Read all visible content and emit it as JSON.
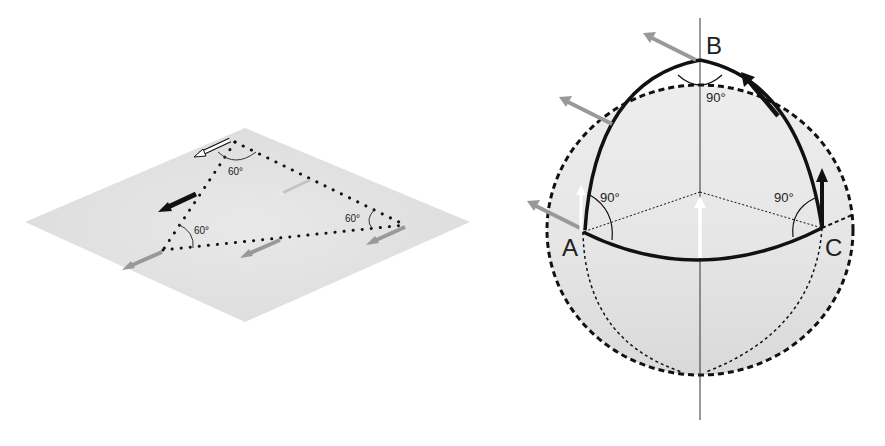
{
  "flat_diagram": {
    "description": "Parallel transport on a flat plane along a triangle",
    "angles": [
      {
        "label": "60°",
        "vertex": "top"
      },
      {
        "label": "60°",
        "vertex": "left"
      },
      {
        "label": "60°",
        "vertex": "right"
      }
    ],
    "angle_sum_note": ""
  },
  "sphere_diagram": {
    "description": "Parallel transport on a sphere along a spherical triangle",
    "vertices": [
      {
        "label": "A"
      },
      {
        "label": "B"
      },
      {
        "label": "C"
      }
    ],
    "angles": [
      {
        "label": "90°",
        "vertex": "B"
      },
      {
        "label": "90°",
        "vertex": "A"
      },
      {
        "label": "90°",
        "vertex": "C"
      }
    ]
  },
  "colors": {
    "plane_fill": "#e4e4e4",
    "sphere_fill": "#e0e0e0",
    "line": "#111111",
    "arrow_gray": "#9a9a9a",
    "arrow_white": "#ffffff",
    "arrow_black": "#111111"
  }
}
